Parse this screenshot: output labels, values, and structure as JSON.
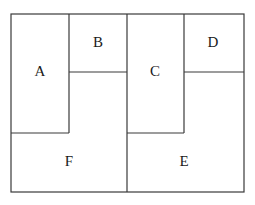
{
  "diagram": {
    "type": "partitioned-rectangle",
    "regions": [
      {
        "id": "A",
        "label": "A",
        "x": 40,
        "y": 73
      },
      {
        "id": "B",
        "label": "B",
        "x": 98,
        "y": 44
      },
      {
        "id": "C",
        "label": "C",
        "x": 155,
        "y": 73
      },
      {
        "id": "D",
        "label": "D",
        "x": 213,
        "y": 44
      },
      {
        "id": "F",
        "label": "F",
        "x": 69,
        "y": 163
      },
      {
        "id": "E",
        "label": "E",
        "x": 184,
        "y": 163
      }
    ],
    "stroke_color": "#3a3a3a",
    "background": "#ffffff"
  }
}
